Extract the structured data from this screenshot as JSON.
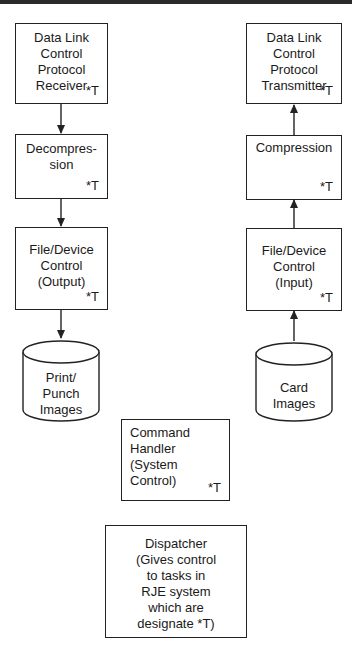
{
  "diagram": {
    "type": "flow",
    "left_column": {
      "boxes": [
        {
          "id": "dlc-receiver",
          "label": "Data Link\nControl\nProtocol\nReceiver",
          "tag": "*T"
        },
        {
          "id": "decompression",
          "label": "Decompres-\nsion",
          "tag": "*T"
        },
        {
          "id": "file-device-output",
          "label": "File/Device\nControl\n(Output)",
          "tag": "*T"
        }
      ],
      "storage": {
        "id": "print-punch-images",
        "label": "Print/\nPunch\nImages"
      },
      "flow_direction": "down"
    },
    "right_column": {
      "boxes": [
        {
          "id": "dlc-transmitter",
          "label": "Data Link\nControl\nProtocol\nTransmitter",
          "tag": "*T"
        },
        {
          "id": "compression",
          "label": "Compression",
          "tag": "*T"
        },
        {
          "id": "file-device-input",
          "label": "File/Device\nControl\n(Input)",
          "tag": "*T"
        }
      ],
      "storage": {
        "id": "card-images",
        "label": "Card\nImages"
      },
      "flow_direction": "up"
    },
    "command_handler": {
      "label": "Command\nHandler\n(System\nControl)",
      "tag": "*T"
    },
    "dispatcher": {
      "label": "Dispatcher\n(Gives control\nto tasks in\nRJE system\nwhich are\ndesignate *T)"
    },
    "edges": [
      {
        "from": "dlc-receiver",
        "to": "decompression"
      },
      {
        "from": "decompression",
        "to": "file-device-output"
      },
      {
        "from": "file-device-output",
        "to": "print-punch-images"
      },
      {
        "from": "card-images",
        "to": "file-device-input"
      },
      {
        "from": "file-device-input",
        "to": "compression"
      },
      {
        "from": "compression",
        "to": "dlc-transmitter"
      }
    ]
  }
}
